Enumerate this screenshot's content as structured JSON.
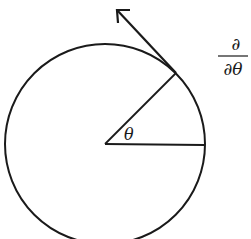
{
  "diagram": {
    "colors": {
      "stroke": "#1a1a1a",
      "background": "#ffffff"
    },
    "circle": {
      "cx": 105,
      "cy": 144,
      "r": 100
    },
    "angle_label": "θ",
    "operator_label": {
      "numerator": "∂",
      "denominator": "∂θ"
    }
  }
}
